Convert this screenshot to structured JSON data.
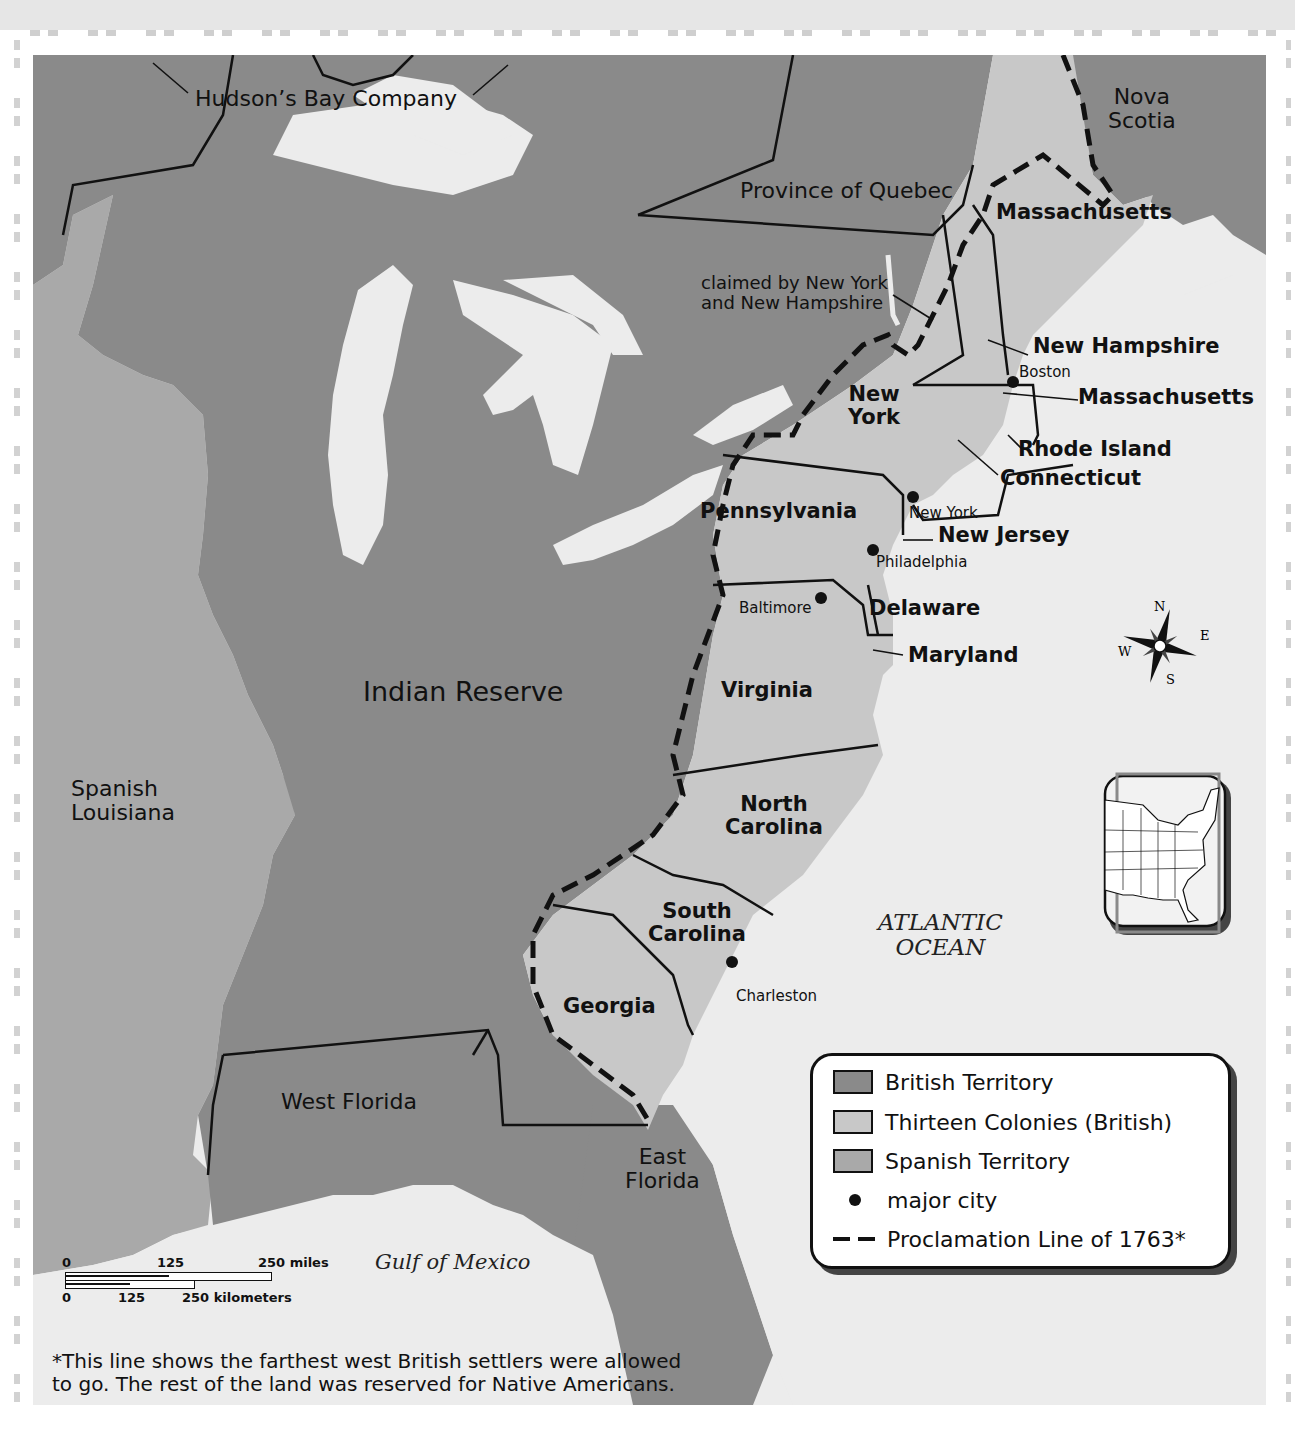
{
  "map": {
    "title_regions": {
      "hudsons_bay": "Hudson’s Bay Company",
      "nova_scotia_line1": "Nova",
      "nova_scotia_line2": "Scotia",
      "quebec": "Province of Quebec",
      "massachusetts_north": "Massachusetts",
      "claimed_line1": "claimed by New York",
      "claimed_line2": "and New Hampshire",
      "indian_reserve": "Indian Reserve",
      "spanish_louisiana_line1": "Spanish",
      "spanish_louisiana_line2": "Louisiana",
      "west_florida": "West Florida",
      "east_florida_line1": "East",
      "east_florida_line2": "Florida"
    },
    "colonies": {
      "new_hampshire": "New Hampshire",
      "massachusetts": "Massachusetts",
      "rhode_island": "Rhode Island",
      "connecticut": "Connecticut",
      "new_york_line1": "New",
      "new_york_line2": "York",
      "pennsylvania": "Pennsylvania",
      "new_jersey": "New Jersey",
      "delaware": "Delaware",
      "maryland": "Maryland",
      "virginia": "Virginia",
      "north_carolina_line1": "North",
      "north_carolina_line2": "Carolina",
      "south_carolina_line1": "South",
      "south_carolina_line2": "Carolina",
      "georgia": "Georgia"
    },
    "cities": {
      "boston": "Boston",
      "new_york": "New York",
      "philadelphia": "Philadelphia",
      "baltimore": "Baltimore",
      "charleston": "Charleston"
    },
    "water": {
      "atlantic_line1": "ATLANTIC",
      "atlantic_line2": "OCEAN",
      "gulf": "Gulf of Mexico"
    },
    "compass": {
      "n": "N",
      "s": "S",
      "e": "E",
      "w": "W"
    },
    "colors": {
      "british_territory": "#8a8a8a",
      "thirteen_colonies": "#c8c8c8",
      "spanish_territory": "#a9a9a9",
      "water": "#ececec",
      "outline": "#111111"
    }
  },
  "legend": {
    "items": [
      {
        "label": "British Territory",
        "symbol": "swatch",
        "color": "#8a8a8a"
      },
      {
        "label": "Thirteen Colonies (British)",
        "symbol": "swatch",
        "color": "#c8c8c8"
      },
      {
        "label": "Spanish Territory",
        "symbol": "swatch",
        "color": "#a9a9a9"
      },
      {
        "label": "major city",
        "symbol": "dot"
      },
      {
        "label": "Proclamation Line of 1763*",
        "symbol": "dashed-line"
      }
    ]
  },
  "scale_bar": {
    "miles": {
      "zero": "0",
      "mid": "125",
      "end": "250 miles"
    },
    "km": {
      "zero": "0",
      "mid": "125",
      "end": "250 kilometers"
    }
  },
  "footnote": {
    "line1": "*This line shows the farthest west British settlers were allowed",
    "line2": "to go. The rest of the land was reserved for Native Americans."
  }
}
